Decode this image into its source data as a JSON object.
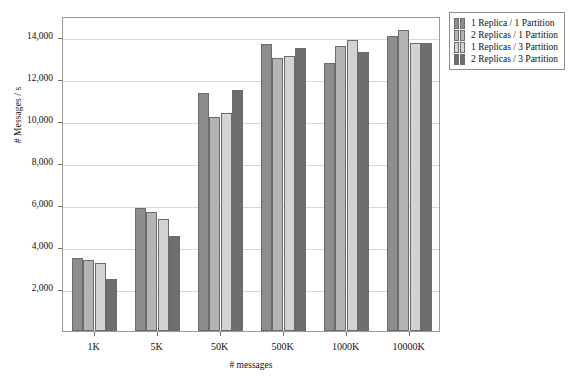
{
  "chart_data": {
    "type": "bar",
    "title": "",
    "xlabel": "# messages",
    "ylabel": "# Messages / s",
    "categories": [
      "1K",
      "5K",
      "50K",
      "500K",
      "1000K",
      "10000K"
    ],
    "ylim": [
      0,
      15000
    ],
    "yticks": [
      2000,
      4000,
      6000,
      8000,
      10000,
      12000,
      14000
    ],
    "ytick_labels": [
      "2,000",
      "4,000",
      "6,000",
      "8,000",
      "10,000",
      "12,000",
      "14,000"
    ],
    "grid": true,
    "legend_position": "outside-top-right",
    "series": [
      {
        "name": "1 Replica / 1 Partition",
        "color": "#8d8d8d",
        "values": [
          3500,
          5850,
          11350,
          13650,
          12750,
          14050
        ]
      },
      {
        "name": "2 Replicas / 1 Partition",
        "color": "#b4b4b4",
        "values": [
          3380,
          5650,
          10200,
          13000,
          13550,
          14350
        ]
      },
      {
        "name": "1 Replicas / 3 Partition",
        "color": "#d3d3d3",
        "values": [
          3250,
          5350,
          10400,
          13100,
          13850,
          13700
        ]
      },
      {
        "name": "2 Replicas / 3 Partition",
        "color": "#6e6e6e",
        "values": [
          2500,
          4520,
          11500,
          13500,
          13300,
          13700
        ]
      }
    ]
  },
  "legend": {
    "items": [
      {
        "label": "1 Replica / 1 Partition"
      },
      {
        "label": "2 Replicas / 1 Partition"
      },
      {
        "label": "1 Replicas / 3 Partition"
      },
      {
        "label": "2 Replicas / 3 Partition"
      }
    ]
  }
}
